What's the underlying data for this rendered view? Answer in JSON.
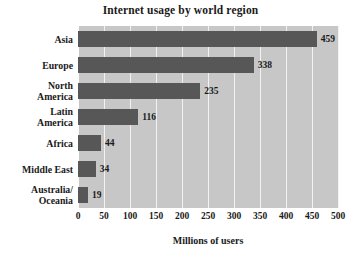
{
  "chart_data": {
    "type": "bar",
    "orientation": "horizontal",
    "title": "Internet usage by world region",
    "xlabel": "Millions of users",
    "ylabel": "",
    "categories": [
      "Asia",
      "Europe",
      "North\nAmerica",
      "Latin\nAmerica",
      "Africa",
      "Middle East",
      "Australia/\nOceania"
    ],
    "values": [
      459,
      338,
      235,
      116,
      44,
      34,
      19
    ],
    "data_labels": [
      "459",
      "338",
      "235",
      "116",
      "44",
      "34",
      "19"
    ],
    "xlim": [
      0,
      500
    ],
    "xticks": [
      0,
      50,
      100,
      150,
      200,
      250,
      300,
      350,
      400,
      450,
      500
    ],
    "xtick_labels": [
      "0",
      "50",
      "100",
      "150",
      "200",
      "250",
      "300",
      "350",
      "400",
      "450",
      "500"
    ],
    "grid": true,
    "grid_axis": "x",
    "legend": false,
    "colors": {
      "bar": "#575757",
      "plot_background": "#c7c7c7",
      "gridline": "#f2f2f2",
      "text": "#1a1a1a",
      "figure_background": "#ffffff"
    }
  }
}
